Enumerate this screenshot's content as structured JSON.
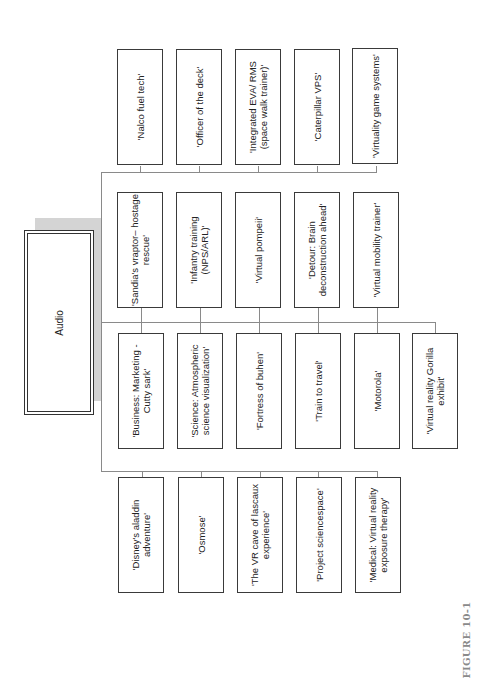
{
  "diagram": {
    "root": {
      "label": "Audio"
    },
    "rows": [
      {
        "name": "row-1",
        "items": [
          "'Nalco fuel tech'",
          "'Officer of the deck'",
          "'Integrated EVA/ RMS (space walk trainer)'",
          "'Caterpillar VPS'",
          "'Virtuality game systems'"
        ]
      },
      {
        "name": "row-2",
        "items": [
          "'Sandia's vraptor– hostage rescue'",
          "'Infantry training (NPS/ARL)'",
          "'Virtual pompeii'",
          "'Detour: Brain deconstruction ahead'",
          "'Virtual mobility trainer'"
        ]
      },
      {
        "name": "row-3",
        "items": [
          "'Business: Marketing -Cutty sark'",
          "'Science: Atmospheric science visualization'",
          "'Fortress of buhen'",
          "'Train to travel'",
          "'Motorola'",
          "'Virtual reality Gorilla exhibit'"
        ]
      },
      {
        "name": "row-4",
        "items": [
          "'Disney's aladdin adventure'",
          "'Osmose'",
          "'The VR cave of lascaux experience'",
          "'Project sciencespace'",
          "'Medical: Virtual reality exposure therapy'"
        ]
      }
    ],
    "caption": "FIGURE 10-1"
  }
}
